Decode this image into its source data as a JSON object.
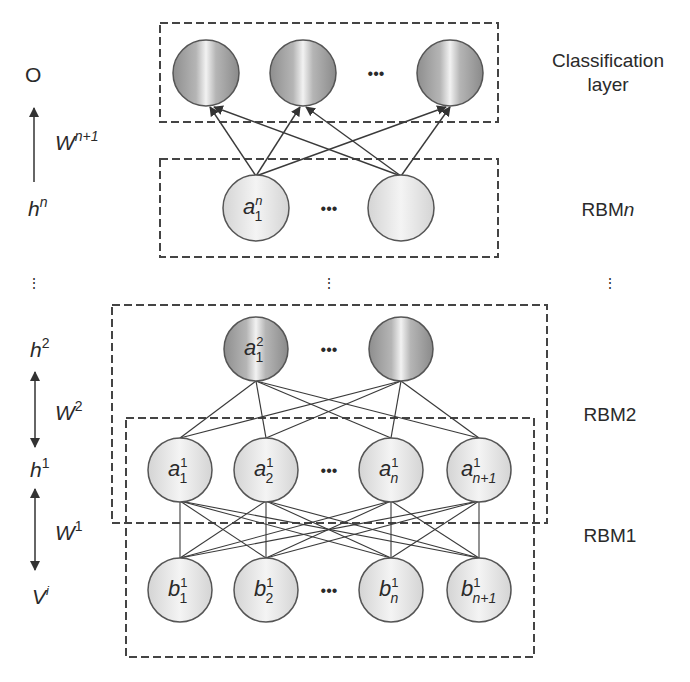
{
  "diagram": {
    "type": "Deep Belief Network architecture (stacked RBMs)",
    "left_axis": {
      "output": "O",
      "weights_top": {
        "base": "W",
        "sup": "n+1"
      },
      "h_n": {
        "base": "h",
        "sup": "n"
      },
      "h_2": {
        "base": "h",
        "sup": "2"
      },
      "weights_2": {
        "base": "W",
        "sup": "2"
      },
      "h_1": {
        "base": "h",
        "sup": "1"
      },
      "weights_1": {
        "base": "W",
        "sup": "1"
      },
      "visible": {
        "base": "V",
        "sup": "i"
      }
    },
    "right_labels": {
      "classification_line1": "Classification",
      "classification_line2": "layer",
      "rbm_n": {
        "base": "RBM",
        "ital": "n"
      },
      "rbm2": "RBM2",
      "rbm1": "RBM1"
    },
    "ellipsis": "•••",
    "layers": {
      "classification": {
        "nodes": [
          "",
          "",
          ""
        ],
        "has_ellipsis": true
      },
      "rbm_n": {
        "nodes": [
          {
            "base": "a",
            "sup": "n",
            "sub": "1"
          },
          {
            "base": "",
            "sup": "",
            "sub": ""
          }
        ]
      },
      "h2": {
        "nodes": [
          {
            "base": "a",
            "sup": "2",
            "sub": "1"
          },
          {
            "base": "",
            "sup": "",
            "sub": ""
          }
        ]
      },
      "h1": {
        "nodes": [
          {
            "base": "a",
            "sup": "1",
            "sub": "1"
          },
          {
            "base": "a",
            "sup": "1",
            "sub": "2"
          },
          {
            "base": "a",
            "sup": "1",
            "sub": "n"
          },
          {
            "base": "a",
            "sup": "1",
            "sub": "n+1"
          }
        ]
      },
      "visible": {
        "nodes": [
          {
            "base": "b",
            "sup": "1",
            "sub": "1"
          },
          {
            "base": "b",
            "sup": "1",
            "sub": "2"
          },
          {
            "base": "b",
            "sup": "1",
            "sub": "n"
          },
          {
            "base": "b",
            "sup": "1",
            "sub": "n+1"
          }
        ]
      }
    },
    "colors": {
      "stroke": "#3a3a3a",
      "dark_node_edge": "#8a8a8a",
      "light_node": "#e6e6e6",
      "box_dash": "#444444"
    }
  }
}
